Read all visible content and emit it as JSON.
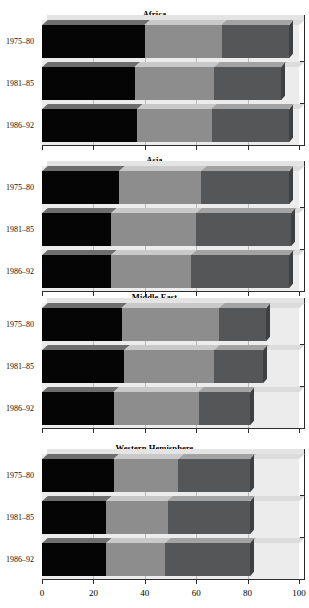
{
  "figure": {
    "kind": "stacked-horizontal-bar-panels",
    "x_axis": {
      "ticks": [
        "0",
        "20",
        "40",
        "60",
        "80",
        "100"
      ],
      "min": 0,
      "max": 100
    },
    "colors": {
      "segment_1": "#050505",
      "segment_2": "#8d8d8d",
      "segment_3": "#555657",
      "plot_background": "#ececed",
      "page_background": "#ffffff"
    }
  },
  "chart_data": {
    "type": "bar",
    "title": "",
    "xlabel": "",
    "ylabel": "",
    "xlim": [
      0,
      100
    ],
    "grid": true,
    "legend": "none",
    "orientation": "horizontal",
    "stacked": true,
    "categories": [
      "1975–80",
      "1981–85",
      "1986–92"
    ],
    "series_names": [
      "Segment 1",
      "Segment 2",
      "Segment 3"
    ],
    "panels": [
      {
        "title": "Africa",
        "categories": [
          "1975–80",
          "1981–85",
          "1986–92"
        ],
        "series": [
          {
            "name": "Segment 1",
            "values": [
              40,
              36,
              37
            ]
          },
          {
            "name": "Segment 2",
            "values": [
              30,
              31,
              29
            ]
          },
          {
            "name": "Segment 3",
            "values": [
              26,
              26,
              30
            ]
          }
        ],
        "cumulative": [
          [
            40,
            70,
            96
          ],
          [
            36,
            67,
            93
          ],
          [
            37,
            66,
            96
          ]
        ]
      },
      {
        "title": "Asia",
        "categories": [
          "1975–80",
          "1981–85",
          "1986–92"
        ],
        "series": [
          {
            "name": "Segment 1",
            "values": [
              30,
              27,
              27
            ]
          },
          {
            "name": "Segment 2",
            "values": [
              32,
              33,
              31
            ]
          },
          {
            "name": "Segment 3",
            "values": [
              34,
              37,
              38
            ]
          }
        ],
        "cumulative": [
          [
            30,
            62,
            96
          ],
          [
            27,
            60,
            97
          ],
          [
            27,
            58,
            96
          ]
        ]
      },
      {
        "title": "Middle East",
        "categories": [
          "1975–80",
          "1981–85",
          "1986–92"
        ],
        "series": [
          {
            "name": "Segment 1",
            "values": [
              31,
              32,
              28
            ]
          },
          {
            "name": "Segment 2",
            "values": [
              38,
              35,
              33
            ]
          },
          {
            "name": "Segment 3",
            "values": [
              18,
              19,
              20
            ]
          }
        ],
        "cumulative": [
          [
            31,
            69,
            87
          ],
          [
            32,
            67,
            86
          ],
          [
            28,
            61,
            81
          ]
        ]
      },
      {
        "title": "Western Hemisphere",
        "categories": [
          "1975–80",
          "1981–85",
          "1986–92"
        ],
        "series": [
          {
            "name": "Segment 1",
            "values": [
              28,
              25,
              25
            ]
          },
          {
            "name": "Segment 2",
            "values": [
              25,
              24,
              23
            ]
          },
          {
            "name": "Segment 3",
            "values": [
              28,
              32,
              33
            ]
          }
        ],
        "cumulative": [
          [
            28,
            53,
            81
          ],
          [
            25,
            49,
            81
          ],
          [
            25,
            48,
            81
          ]
        ]
      }
    ]
  }
}
